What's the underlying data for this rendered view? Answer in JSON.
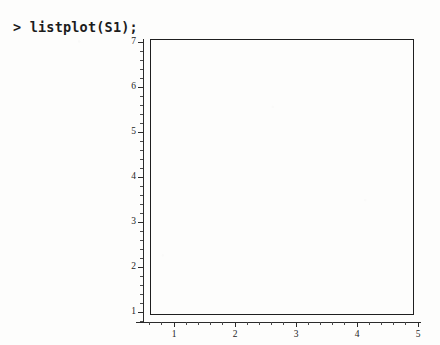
{
  "session": {
    "prompt": ">",
    "command": "listplot(S1);",
    "command_line": "> listplot(S1);"
  },
  "colors": {
    "background": "#fdfdfc",
    "ink": "#1f1f1f",
    "axis": "#2a2a2a",
    "label": "#242424"
  },
  "chart_data": {
    "type": "scatter",
    "title": "",
    "subtitle": "",
    "xlabel": "",
    "ylabel": "",
    "x": [],
    "values": [],
    "series": [
      {
        "name": "S1",
        "x": [],
        "values": []
      }
    ],
    "xlim": [
      0.65,
      5.0
    ],
    "ylim": [
      0.72,
      7.0
    ],
    "xticks": [
      1,
      2,
      3,
      4,
      5
    ],
    "yticks": [
      1,
      2,
      3,
      4,
      5,
      6,
      7
    ],
    "xtick_labels": [
      "1",
      "2",
      "3",
      "4",
      "5"
    ],
    "ytick_labels": [
      "1",
      "2",
      "3",
      "4",
      "5",
      "6",
      "7"
    ],
    "minor_ticks_per_interval": 4,
    "grid": false,
    "legend": false,
    "legend_position": "none",
    "frame": true,
    "annotations": []
  }
}
